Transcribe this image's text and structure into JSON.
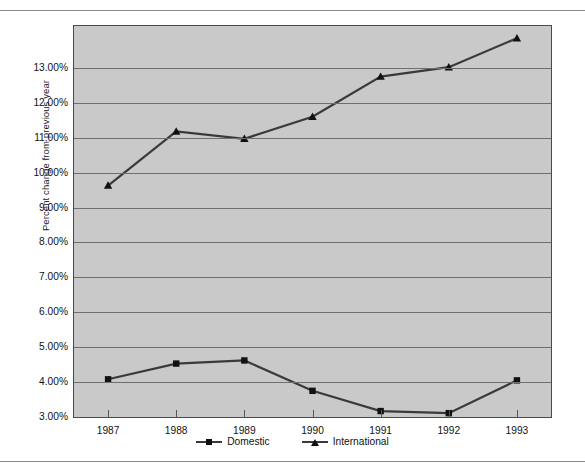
{
  "chart_data": {
    "type": "line",
    "title": "",
    "xlabel": "",
    "ylabel": "Percent change from previous year",
    "categories": [
      "1987",
      "1988",
      "1989",
      "1990",
      "1991",
      "1992",
      "1993"
    ],
    "ylim": [
      3.0,
      14.2
    ],
    "ytick_labels": [
      "3.00%",
      "4.00%",
      "5.00%",
      "6.00%",
      "7.00%",
      "8.00%",
      "9.00%",
      "10.00%",
      "11.00%",
      "12.00%",
      "13.00%"
    ],
    "ytick_values": [
      3.0,
      4.0,
      5.0,
      6.0,
      7.0,
      8.0,
      9.0,
      10.0,
      11.0,
      12.0,
      13.0
    ],
    "grid": true,
    "legend_position": "bottom",
    "series": [
      {
        "name": "Domestic",
        "marker": "square",
        "color": "#3a3a3a",
        "values": [
          4.08,
          4.53,
          4.62,
          3.75,
          3.17,
          3.11,
          4.05
        ]
      },
      {
        "name": "International",
        "marker": "triangle",
        "color": "#3a3a3a",
        "values": [
          9.63,
          11.18,
          10.97,
          11.6,
          12.75,
          13.02,
          13.85
        ]
      }
    ]
  },
  "legend": {
    "items": [
      {
        "label": "Domestic",
        "marker": "square-marker-icon"
      },
      {
        "label": "International",
        "marker": "triangle-marker-icon"
      }
    ]
  },
  "colors": {
    "plot_background": "#c9c9c9",
    "gridline": "#6f6f6f",
    "series_line": "#3a3a3a",
    "marker": "#111111",
    "rule": "#8a8a8a"
  }
}
